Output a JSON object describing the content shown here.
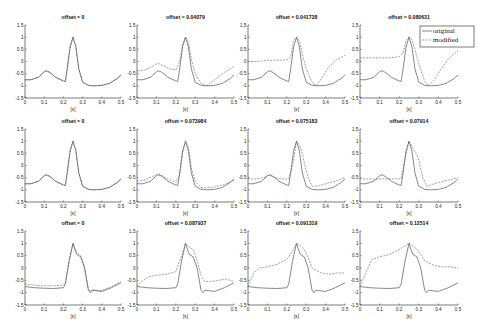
{
  "chart_data": {
    "type": "line",
    "layout": {
      "rows": 3,
      "cols": 4
    },
    "shared": {
      "xlabel": "[s]",
      "ylabel": "",
      "xlim": [
        0,
        0.5
      ],
      "ylim": [
        -1.5,
        1.5
      ],
      "xticks": [
        "0",
        "0.1",
        "0.2",
        "0.3",
        "0.4",
        "0.5"
      ],
      "yticks": [
        "-1.5",
        "-1",
        "-0.5",
        "0",
        "0.5",
        "1",
        "1.5"
      ],
      "grid": false
    },
    "legend": {
      "panel": 3,
      "position": "northeast",
      "entries": [
        "original",
        "modified"
      ]
    },
    "original_waveforms": {
      "A": {
        "x": [
          0,
          0.03,
          0.07,
          0.1,
          0.11,
          0.13,
          0.16,
          0.2,
          0.21,
          0.22,
          0.235,
          0.25,
          0.265,
          0.28,
          0.3,
          0.33,
          0.36,
          0.4,
          0.44,
          0.48,
          0.5
        ],
        "y": [
          -0.75,
          -0.75,
          -0.65,
          -0.42,
          -0.38,
          -0.45,
          -0.65,
          -0.8,
          -0.82,
          -0.3,
          0.6,
          1.0,
          0.6,
          -0.3,
          -0.85,
          -0.98,
          -1.0,
          -0.98,
          -0.9,
          -0.7,
          -0.55
        ]
      },
      "B": {
        "x": [
          0,
          0.05,
          0.1,
          0.15,
          0.2,
          0.21,
          0.23,
          0.25,
          0.26,
          0.27,
          0.29,
          0.31,
          0.33,
          0.34,
          0.35,
          0.37,
          0.4,
          0.45,
          0.5
        ],
        "y": [
          -0.75,
          -0.8,
          -0.82,
          -0.83,
          -0.8,
          -0.65,
          0.3,
          1.0,
          0.75,
          0.55,
          0.45,
          0.0,
          -0.9,
          -1.0,
          -0.9,
          -0.92,
          -0.95,
          -0.8,
          -0.6
        ]
      }
    },
    "panels": [
      {
        "title": "offset = 0",
        "original": "A",
        "modified": {
          "x": [
            0,
            0.03,
            0.07,
            0.1,
            0.11,
            0.13,
            0.16,
            0.2,
            0.21,
            0.22,
            0.235,
            0.25,
            0.265,
            0.28,
            0.3,
            0.33,
            0.36,
            0.4,
            0.44,
            0.48,
            0.5
          ],
          "y": [
            -0.75,
            -0.75,
            -0.65,
            -0.42,
            -0.38,
            -0.45,
            -0.65,
            -0.8,
            -0.82,
            -0.3,
            0.6,
            1.0,
            0.6,
            -0.3,
            -0.85,
            -0.98,
            -1.0,
            -0.98,
            -0.9,
            -0.7,
            -0.55
          ]
        }
      },
      {
        "title": "offset = 0.04079",
        "original": "A",
        "modified": {
          "x": [
            0,
            0.04,
            0.08,
            0.1,
            0.11,
            0.13,
            0.17,
            0.2,
            0.22,
            0.235,
            0.25,
            0.265,
            0.28,
            0.3,
            0.33,
            0.36,
            0.4,
            0.45,
            0.5
          ],
          "y": [
            -0.38,
            -0.35,
            -0.2,
            -0.1,
            -0.08,
            -0.15,
            -0.3,
            -0.35,
            0.0,
            0.7,
            1.0,
            0.8,
            0.1,
            -0.5,
            -0.9,
            -1.0,
            -0.75,
            -0.45,
            -0.2
          ]
        }
      },
      {
        "title": "offset = 0.041738",
        "original": "A",
        "modified": {
          "x": [
            0,
            0.05,
            0.1,
            0.15,
            0.2,
            0.22,
            0.235,
            0.25,
            0.265,
            0.28,
            0.3,
            0.33,
            0.35,
            0.38,
            0.41,
            0.45,
            0.5
          ],
          "y": [
            0.0,
            0.0,
            0.05,
            0.05,
            0.07,
            0.2,
            0.85,
            1.0,
            0.85,
            0.3,
            -0.3,
            -0.85,
            -1.0,
            -0.7,
            -0.3,
            0.05,
            0.25
          ]
        }
      },
      {
        "title": "offset = 0.080631",
        "original": "A",
        "modified": {
          "x": [
            0,
            0.05,
            0.1,
            0.15,
            0.2,
            0.22,
            0.235,
            0.25,
            0.265,
            0.28,
            0.3,
            0.33,
            0.35,
            0.38,
            0.41,
            0.45,
            0.5
          ],
          "y": [
            0.15,
            0.15,
            0.15,
            0.15,
            0.2,
            0.35,
            0.85,
            1.0,
            0.9,
            0.5,
            -0.1,
            -0.8,
            -1.0,
            -0.75,
            -0.35,
            0.1,
            0.45
          ]
        }
      },
      {
        "title": "offset = 0",
        "original": "A",
        "modified": {
          "x": [
            0,
            0.03,
            0.07,
            0.1,
            0.11,
            0.13,
            0.16,
            0.2,
            0.21,
            0.22,
            0.235,
            0.25,
            0.265,
            0.28,
            0.3,
            0.33,
            0.36,
            0.4,
            0.44,
            0.48,
            0.5
          ],
          "y": [
            -0.75,
            -0.75,
            -0.65,
            -0.42,
            -0.38,
            -0.45,
            -0.65,
            -0.8,
            -0.82,
            -0.3,
            0.6,
            1.0,
            0.6,
            -0.3,
            -0.85,
            -0.98,
            -1.0,
            -0.98,
            -0.9,
            -0.7,
            -0.55
          ]
        }
      },
      {
        "title": "offset = 0.073984",
        "original": "A",
        "modified": {
          "x": [
            0,
            0.04,
            0.08,
            0.1,
            0.11,
            0.13,
            0.17,
            0.2,
            0.22,
            0.235,
            0.25,
            0.265,
            0.28,
            0.3,
            0.33,
            0.36,
            0.4,
            0.45,
            0.5
          ],
          "y": [
            -0.65,
            -0.6,
            -0.45,
            -0.38,
            -0.35,
            -0.42,
            -0.6,
            -0.68,
            -0.4,
            0.5,
            1.0,
            0.75,
            -0.1,
            -0.65,
            -0.9,
            -0.92,
            -0.88,
            -0.78,
            -0.6
          ]
        }
      },
      {
        "title": "offset = 0.075183",
        "original": "A",
        "modified": {
          "x": [
            0,
            0.04,
            0.08,
            0.1,
            0.11,
            0.14,
            0.18,
            0.21,
            0.23,
            0.25,
            0.265,
            0.28,
            0.29,
            0.31,
            0.33,
            0.36,
            0.4,
            0.45,
            0.5
          ],
          "y": [
            -0.55,
            -0.55,
            -0.5,
            -0.42,
            -0.4,
            -0.5,
            -0.55,
            -0.55,
            0.0,
            1.0,
            0.85,
            0.5,
            0.1,
            -0.5,
            -0.85,
            -0.85,
            -0.75,
            -0.65,
            -0.5
          ]
        }
      },
      {
        "title": "offset = 0.07914",
        "original": "A",
        "modified": {
          "x": [
            0,
            0.04,
            0.08,
            0.1,
            0.11,
            0.14,
            0.18,
            0.21,
            0.23,
            0.25,
            0.27,
            0.29,
            0.3,
            0.32,
            0.34,
            0.36,
            0.4,
            0.45,
            0.5
          ],
          "y": [
            -0.55,
            -0.55,
            -0.57,
            -0.55,
            -0.55,
            -0.55,
            -0.55,
            -0.55,
            0.3,
            1.0,
            0.7,
            0.45,
            0.2,
            -0.5,
            -0.85,
            -0.8,
            -0.7,
            -0.6,
            -0.5
          ]
        }
      },
      {
        "title": "offset = 0",
        "original": "B",
        "modified": {
          "x": [
            0,
            0.05,
            0.1,
            0.15,
            0.2,
            0.21,
            0.23,
            0.25,
            0.26,
            0.27,
            0.29,
            0.31,
            0.33,
            0.34,
            0.35,
            0.37,
            0.4,
            0.45,
            0.5
          ],
          "y": [
            -0.65,
            -0.7,
            -0.72,
            -0.72,
            -0.7,
            -0.6,
            0.3,
            1.0,
            0.8,
            0.65,
            0.5,
            0.05,
            -0.85,
            -0.95,
            -0.88,
            -0.9,
            -0.92,
            -0.75,
            -0.55
          ]
        }
      },
      {
        "title": "offset = 0.087937",
        "original": "B",
        "modified": {
          "x": [
            0,
            0.03,
            0.06,
            0.1,
            0.15,
            0.2,
            0.23,
            0.25,
            0.27,
            0.29,
            0.31,
            0.33,
            0.35,
            0.38,
            0.42,
            0.46,
            0.5
          ],
          "y": [
            -0.75,
            -0.5,
            -0.35,
            -0.3,
            -0.25,
            -0.15,
            0.5,
            1.0,
            0.85,
            0.75,
            0.3,
            -0.3,
            -0.55,
            -0.55,
            -0.5,
            -0.45,
            -0.55
          ]
        }
      },
      {
        "title": "offset = 0.091319",
        "original": "B",
        "modified": {
          "x": [
            0,
            0.03,
            0.06,
            0.1,
            0.15,
            0.2,
            0.23,
            0.25,
            0.27,
            0.29,
            0.31,
            0.33,
            0.35,
            0.38,
            0.42,
            0.46,
            0.5
          ],
          "y": [
            -0.75,
            -0.2,
            0.0,
            0.05,
            0.15,
            0.35,
            0.7,
            1.0,
            0.9,
            0.75,
            0.45,
            0.0,
            -0.1,
            -0.2,
            -0.25,
            -0.2,
            -0.2
          ]
        }
      },
      {
        "title": "offset = 0.12514",
        "original": "B",
        "modified": {
          "x": [
            0,
            0.03,
            0.06,
            0.1,
            0.15,
            0.2,
            0.23,
            0.25,
            0.27,
            0.29,
            0.31,
            0.33,
            0.35,
            0.38,
            0.42,
            0.46,
            0.5
          ],
          "y": [
            -0.75,
            -0.2,
            0.35,
            0.45,
            0.55,
            0.75,
            0.9,
            1.0,
            0.9,
            0.75,
            0.55,
            0.3,
            0.2,
            0.1,
            0.05,
            0.05,
            0.0
          ]
        }
      }
    ]
  }
}
